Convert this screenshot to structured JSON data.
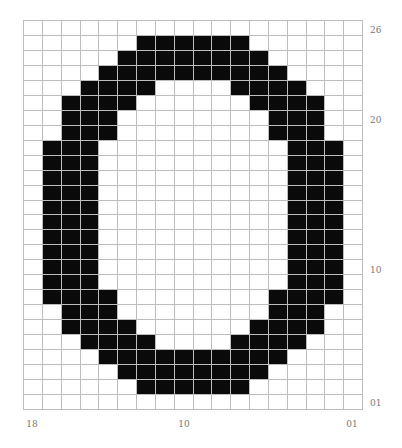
{
  "pattern": {
    "rows": 26,
    "cols": 18,
    "fill_color": "#0a0a0a",
    "grid_color": "#bdbdbd",
    "filled_spans": [
      [],
      [
        [
          6,
          11
        ]
      ],
      [
        [
          5,
          12
        ]
      ],
      [
        [
          4,
          13
        ]
      ],
      [
        [
          3,
          6
        ],
        [
          11,
          14
        ]
      ],
      [
        [
          2,
          5
        ],
        [
          12,
          15
        ]
      ],
      [
        [
          2,
          4
        ],
        [
          13,
          15
        ]
      ],
      [
        [
          2,
          4
        ],
        [
          13,
          15
        ]
      ],
      [
        [
          1,
          3
        ],
        [
          14,
          16
        ]
      ],
      [
        [
          1,
          3
        ],
        [
          14,
          16
        ]
      ],
      [
        [
          1,
          3
        ],
        [
          14,
          16
        ]
      ],
      [
        [
          1,
          3
        ],
        [
          14,
          16
        ]
      ],
      [
        [
          1,
          3
        ],
        [
          14,
          16
        ]
      ],
      [
        [
          1,
          3
        ],
        [
          14,
          16
        ]
      ],
      [
        [
          1,
          3
        ],
        [
          14,
          16
        ]
      ],
      [
        [
          1,
          3
        ],
        [
          14,
          16
        ]
      ],
      [
        [
          1,
          3
        ],
        [
          14,
          16
        ]
      ],
      [
        [
          1,
          3
        ],
        [
          14,
          16
        ]
      ],
      [
        [
          1,
          4
        ],
        [
          13,
          16
        ]
      ],
      [
        [
          2,
          4
        ],
        [
          13,
          15
        ]
      ],
      [
        [
          2,
          5
        ],
        [
          12,
          15
        ]
      ],
      [
        [
          3,
          6
        ],
        [
          11,
          14
        ]
      ],
      [
        [
          4,
          13
        ]
      ],
      [
        [
          5,
          12
        ]
      ],
      [
        [
          6,
          11
        ]
      ],
      []
    ]
  },
  "row_labels": [
    {
      "text": "26",
      "row": 0
    },
    {
      "text": "20",
      "row": 6
    },
    {
      "text": "10",
      "row": 16
    },
    {
      "text": "01",
      "row": 25
    }
  ],
  "col_labels": [
    {
      "text": "18",
      "col": 0
    },
    {
      "text": "10",
      "col": 8
    },
    {
      "text": "01",
      "col": 17
    }
  ]
}
